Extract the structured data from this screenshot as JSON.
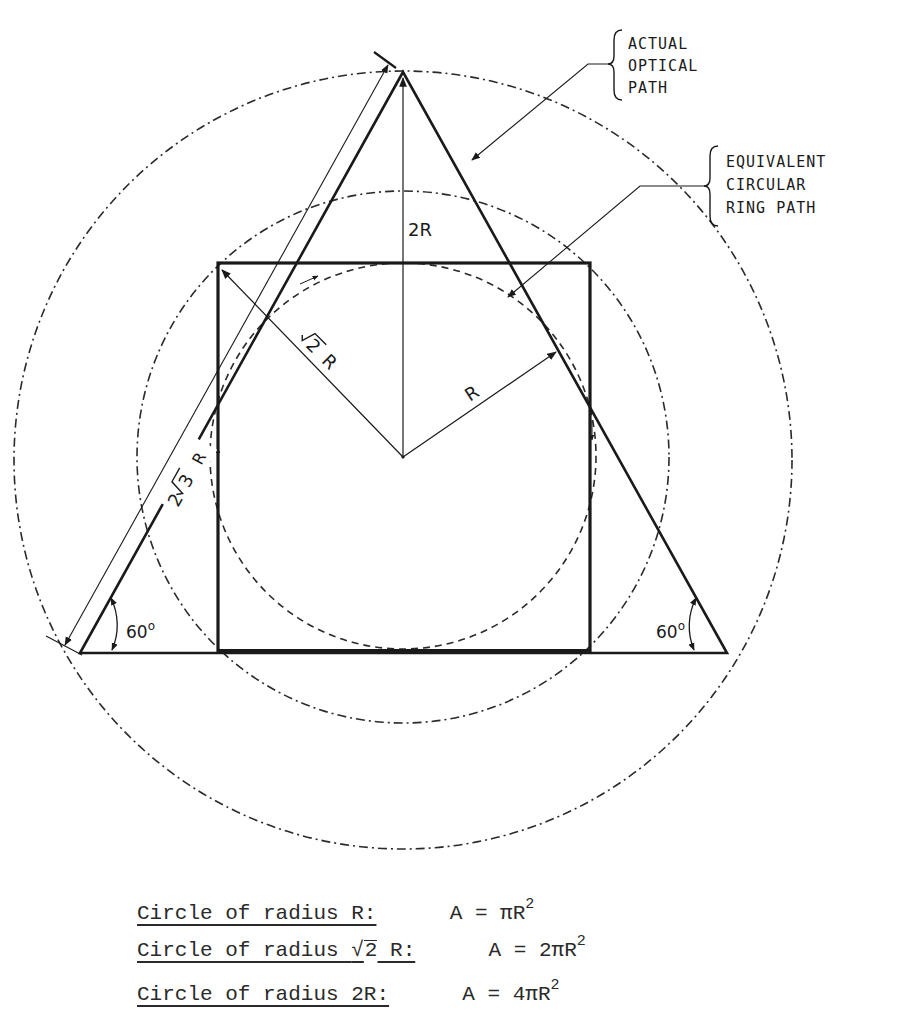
{
  "diagram": {
    "center": {
      "x": 403,
      "y": 457
    },
    "circles": [
      {
        "name": "outer",
        "radius_label": "2R",
        "r": 389,
        "style": "dash-dot"
      },
      {
        "name": "middle",
        "radius_label": "sqrt2 R",
        "r": 266,
        "style": "dash-dot"
      },
      {
        "name": "inner",
        "radius_label": "R",
        "r": 193,
        "style": "dashed"
      }
    ],
    "labels": {
      "two_r": "2R",
      "r": "R",
      "sqrt2_num": "2",
      "sqrt2_r": "R",
      "two_sqrt3_prefix": "2",
      "two_sqrt3_num": "3",
      "two_sqrt3_r": "R",
      "angle_left": "60",
      "angle_right": "60",
      "degree_mark": "o"
    },
    "callouts": {
      "actual_optical_path": [
        "ACTUAL",
        "OPTICAL",
        "PATH"
      ],
      "equivalent_ring_path": [
        "EQUIVALENT",
        "CIRCULAR",
        "RING PATH"
      ]
    },
    "colors": {
      "ink": "#1a1a1a",
      "background": "#ffffff"
    }
  },
  "equations": [
    {
      "label": "Circle of radius R:",
      "formula_prefix": "A = ",
      "coef": "",
      "pi": "π",
      "var": "R",
      "exp": "2"
    },
    {
      "label_pre": "Circle of radius ",
      "label_root": "2",
      "label_post": " R:",
      "formula_prefix": "A = ",
      "coef": "2",
      "pi": "π",
      "var": "R",
      "exp": "2"
    },
    {
      "label": "Circle of radius 2R:",
      "formula_prefix": "A = ",
      "coef": "4",
      "pi": "π",
      "var": "R",
      "exp": "2"
    }
  ]
}
